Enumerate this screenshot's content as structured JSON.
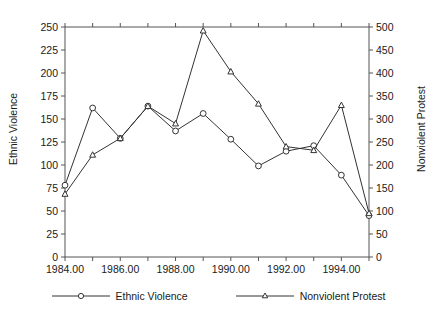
{
  "chart_data": {
    "type": "line",
    "title": "",
    "xlabel": "",
    "x": [
      1984,
      1985,
      1986,
      1987,
      1988,
      1989,
      1990,
      1991,
      1992,
      1993,
      1994,
      1995
    ],
    "xlim": [
      1984,
      1995
    ],
    "xticks": [
      1984,
      1985,
      1986,
      1987,
      1988,
      1989,
      1990,
      1991,
      1992,
      1993,
      1994,
      1995
    ],
    "xticklabels": [
      "1984.00",
      "",
      "1986.00",
      "",
      "1988.00",
      "",
      "1990.00",
      "",
      "1992.00",
      "",
      "1994.00",
      ""
    ],
    "grid": false,
    "legend_position": "bottom",
    "axes": [
      {
        "id": "left",
        "ylabel": "Ethnic Violence",
        "ylim": [
          0,
          250
        ],
        "yticks": [
          0,
          25,
          50,
          75,
          100,
          125,
          150,
          175,
          200,
          225,
          250
        ],
        "yticklabels": [
          "0",
          "25",
          "50",
          "75",
          "100",
          "125",
          "150",
          "175",
          "200",
          "225",
          "250"
        ]
      },
      {
        "id": "right",
        "ylabel": "Nonviolent Protest",
        "ylim": [
          0,
          500
        ],
        "yticks": [
          0,
          50,
          100,
          150,
          200,
          250,
          300,
          350,
          400,
          450,
          500
        ],
        "yticklabels": [
          "0",
          "50",
          "100",
          "150",
          "200",
          "250",
          "300",
          "350",
          "400",
          "450",
          "500"
        ]
      }
    ],
    "series": [
      {
        "name": "Ethnic Violence",
        "axis": "left",
        "marker": "circle",
        "color": "#333333",
        "values": [
          78,
          162,
          129,
          164,
          137,
          156,
          128,
          99,
          115,
          121,
          89,
          45
        ]
      },
      {
        "name": "Nonviolent Protest",
        "axis": "right",
        "marker": "triangle",
        "color": "#333333",
        "values": [
          137,
          222,
          258,
          328,
          290,
          492,
          403,
          333,
          240,
          232,
          330,
          95
        ]
      }
    ]
  },
  "legend": {
    "items": [
      {
        "label": "Ethnic Violence",
        "marker": "circle"
      },
      {
        "label": "Nonviolent Protest",
        "marker": "triangle"
      }
    ]
  },
  "colors": {
    "line": "#333333",
    "axis": "#555555",
    "text": "#1a1a1a",
    "background": "#ffffff"
  }
}
